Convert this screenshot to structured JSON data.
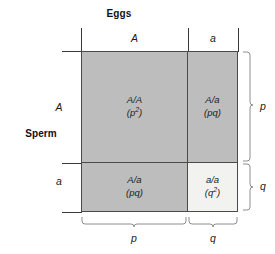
{
  "diagram": {
    "type": "punnett-square",
    "title_top": "Eggs",
    "title_left": "Sperm",
    "columns": [
      {
        "allele": "A",
        "frequency": "p"
      },
      {
        "allele": "a",
        "frequency": "q"
      }
    ],
    "rows": [
      {
        "allele": "A",
        "frequency": "p"
      },
      {
        "allele": "a",
        "frequency": "q"
      }
    ],
    "cells": [
      {
        "row": 0,
        "col": 0,
        "genotype": "A/A",
        "frequency_base": "(p",
        "frequency_exp": "2",
        "frequency_close": ")",
        "shade": "shaded"
      },
      {
        "row": 0,
        "col": 1,
        "genotype": "A/a",
        "frequency_base": "(pq)",
        "frequency_exp": "",
        "frequency_close": "",
        "shade": "shaded"
      },
      {
        "row": 1,
        "col": 0,
        "genotype": "A/a",
        "frequency_base": "(pq)",
        "frequency_exp": "",
        "frequency_close": "",
        "shade": "shaded"
      },
      {
        "row": 1,
        "col": 1,
        "genotype": "a/a",
        "frequency_base": "(q",
        "frequency_exp": "2",
        "frequency_close": ")",
        "shade": "light"
      }
    ],
    "braces": {
      "bottom_left_label": "p",
      "bottom_right_label": "q",
      "right_top_label": "p",
      "right_bottom_label": "q"
    },
    "colors": {
      "shaded_fill": "#bdbdbd",
      "light_fill": "#f2f2f0",
      "grid_line": "#4a4a4a",
      "brace": "#8e8e8e",
      "text": "#1a1a1a"
    }
  }
}
